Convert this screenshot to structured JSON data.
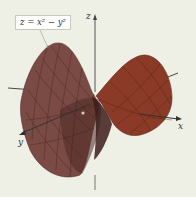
{
  "figure": {
    "equation_label": "z = x² − y²",
    "axes": {
      "z": "z",
      "x": "x",
      "y": "y"
    },
    "surface": {
      "type": "hyperbolic paraboloid (saddle)",
      "fill_color": "#7a4a44",
      "dark_color": "#4a2624",
      "right_lobe_color": "#8a3a26",
      "mesh_color": "#3e201c"
    },
    "background_color": "#eef0e6"
  }
}
